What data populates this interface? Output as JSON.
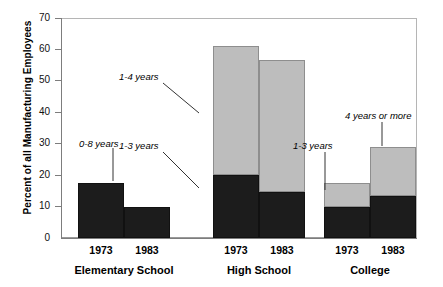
{
  "chart_data": {
    "type": "bar",
    "subtype": "stacked-grouped",
    "title": "",
    "xlabel": "",
    "ylabel": "Percent of all Manufacturing Employees",
    "ylim": [
      0,
      70
    ],
    "yticks": [
      0,
      10,
      20,
      30,
      40,
      50,
      60,
      70
    ],
    "grid": false,
    "legend_position": "none",
    "legend_entries": [],
    "categories": [
      "Elementary School",
      "College"
    ],
    "groups": [
      {
        "label": "Elementary School",
        "bars": [
          {
            "year": "1973",
            "total": 17.5,
            "segments": [
              {
                "name": "0-8 years",
                "value": 17.5,
                "color": "#1c1c1c"
              }
            ]
          },
          {
            "year": "1983",
            "total": 10,
            "segments": [
              {
                "name": "0-8 years",
                "value": 10,
                "color": "#1c1c1c"
              }
            ]
          }
        ]
      },
      {
        "label": "High School",
        "bars": [
          {
            "year": "1973",
            "total": 61,
            "segments": [
              {
                "name": "1-3 years",
                "value": 20,
                "color": "#1c1c1c"
              },
              {
                "name": "1-4 years",
                "value": 41,
                "color": "#bdbdbd"
              }
            ]
          },
          {
            "year": "1983",
            "total": 56.5,
            "segments": [
              {
                "name": "1-3 years",
                "value": 14.5,
                "color": "#1c1c1c"
              },
              {
                "name": "1-4 years",
                "value": 42,
                "color": "#bdbdbd"
              }
            ]
          }
        ]
      },
      {
        "label": "College",
        "bars": [
          {
            "year": "1973",
            "total": 17.5,
            "segments": [
              {
                "name": "1-3 years",
                "value": 10,
                "color": "#1c1c1c"
              },
              {
                "name": "4 years or more",
                "value": 7.5,
                "color": "#bdbdbd"
              }
            ]
          },
          {
            "year": "1983",
            "total": 29,
            "segments": [
              {
                "name": "1-3 years",
                "value": 13.5,
                "color": "#1c1c1c"
              },
              {
                "name": "4 years or more",
                "value": 15.5,
                "color": "#bdbdbd"
              }
            ]
          }
        ]
      }
    ],
    "annotations": [
      {
        "id": "a1",
        "text": "0-8 years"
      },
      {
        "id": "a2",
        "text": "1-3 years"
      },
      {
        "id": "a3",
        "text": "1-4 years"
      },
      {
        "id": "a4",
        "text": "1-3 years"
      },
      {
        "id": "a5",
        "text": "4 years or more"
      }
    ],
    "colors": {
      "dark_segment": "#1c1c1c",
      "light_segment": "#bdbdbd",
      "axis": "#7d7d7d",
      "text": "#000000",
      "background": "#ffffff"
    }
  },
  "axis": {
    "ytick_labels": [
      "70",
      "60",
      "50",
      "40",
      "30",
      "20",
      "10",
      "0"
    ],
    "y_title": "Percent of all Manufacturing Employees"
  },
  "xaxis": {
    "years": [
      "1973",
      "1983",
      "1973",
      "1983",
      "1973",
      "1983"
    ],
    "groups": [
      "Elementary School",
      "High School",
      "College"
    ]
  }
}
